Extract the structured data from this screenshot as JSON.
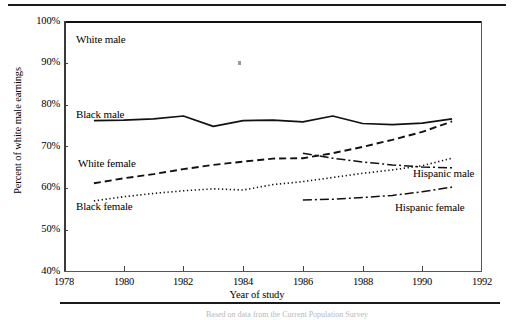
{
  "figure": {
    "caption": "Based on data from the Current Population Survey"
  },
  "chart_data": {
    "type": "line",
    "title": "",
    "xlabel": "Year of study",
    "ylabel": "Percent of white male earnings",
    "xlim": [
      1978,
      1992
    ],
    "ylim": [
      40,
      100
    ],
    "grid": false,
    "legend_position": "inline-annotations",
    "x_ticks": [
      "1978",
      "1980",
      "1982",
      "1984",
      "1986",
      "1988",
      "1990",
      "1992"
    ],
    "x_tick_values": [
      1978,
      1980,
      1982,
      1984,
      1986,
      1988,
      1990,
      1992
    ],
    "y_ticks": [
      "40%",
      "50%",
      "60%",
      "70%",
      "80%",
      "90%",
      "100%"
    ],
    "y_tick_values": [
      40,
      50,
      60,
      70,
      80,
      90,
      100
    ],
    "series": [
      {
        "name": "White male",
        "label": "White male",
        "style": "solid-reference",
        "note": "reference line at 100%, drawn as top frame border",
        "x": [
          1978,
          1992
        ],
        "values": [
          100,
          100
        ]
      },
      {
        "name": "Black male",
        "label": "Black male",
        "style": "solid",
        "x": [
          1979,
          1980,
          1981,
          1982,
          1983,
          1984,
          1985,
          1986,
          1987,
          1988,
          1989,
          1990,
          1991
        ],
        "values": [
          76.2,
          76.3,
          76.6,
          77.3,
          74.8,
          76.2,
          76.3,
          75.9,
          77.3,
          75.5,
          75.2,
          75.6,
          76.6
        ]
      },
      {
        "name": "White female",
        "label": "White female",
        "style": "dashed",
        "x": [
          1979,
          1980,
          1981,
          1982,
          1983,
          1984,
          1985,
          1986,
          1987,
          1988,
          1989,
          1990,
          1991
        ],
        "values": [
          61.2,
          62.4,
          63.4,
          64.6,
          65.6,
          66.4,
          67.1,
          67.2,
          68.4,
          69.9,
          71.6,
          73.5,
          76.0
        ]
      },
      {
        "name": "Black female",
        "label": "Black female",
        "style": "dotted",
        "x": [
          1979,
          1980,
          1981,
          1982,
          1983,
          1984,
          1985,
          1986,
          1987,
          1988,
          1989,
          1990,
          1991
        ],
        "values": [
          57.0,
          58.0,
          58.8,
          59.4,
          59.9,
          59.6,
          60.9,
          61.6,
          62.6,
          63.6,
          64.4,
          65.4,
          67.2
        ]
      },
      {
        "name": "Hispanic male",
        "label": "Hispanic male",
        "style": "dash-dot",
        "x": [
          1986,
          1987,
          1988,
          1989,
          1990,
          1991
        ],
        "values": [
          68.4,
          67.2,
          66.3,
          65.6,
          65.1,
          64.9
        ]
      },
      {
        "name": "Hispanic female",
        "label": "Hispanic female",
        "style": "dash-dot",
        "x": [
          1986,
          1987,
          1988,
          1989,
          1990,
          1991
        ],
        "values": [
          57.2,
          57.4,
          57.8,
          58.3,
          59.2,
          60.3
        ]
      }
    ]
  },
  "colors": {
    "line": "#111111",
    "frame": "#444444",
    "background": "#ffffff"
  }
}
